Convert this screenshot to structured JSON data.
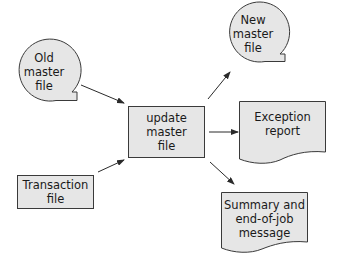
{
  "diagram": {
    "type": "system-flowchart",
    "colors": {
      "fill": "#e6e6e6",
      "stroke": "#3a3a3a",
      "text": "#1a1a1a",
      "background": "#ffffff"
    },
    "nodes": [
      {
        "id": "old_master",
        "shape": "magnetic-tape",
        "lines": [
          "Old",
          "master",
          "file"
        ]
      },
      {
        "id": "transaction",
        "shape": "process-rectangle",
        "lines": [
          "Transaction",
          "file"
        ]
      },
      {
        "id": "update",
        "shape": "process-rectangle",
        "lines": [
          "update",
          "master",
          "file"
        ]
      },
      {
        "id": "new_master",
        "shape": "magnetic-tape",
        "lines": [
          "New",
          "master",
          "file"
        ]
      },
      {
        "id": "exception",
        "shape": "document",
        "lines": [
          "Exception",
          "report"
        ]
      },
      {
        "id": "summary",
        "shape": "document",
        "lines": [
          "Summary and",
          "end-of-job",
          "message"
        ]
      }
    ],
    "edges": [
      {
        "from": "old_master",
        "to": "update"
      },
      {
        "from": "transaction",
        "to": "update"
      },
      {
        "from": "update",
        "to": "new_master"
      },
      {
        "from": "update",
        "to": "exception"
      },
      {
        "from": "update",
        "to": "summary"
      }
    ]
  }
}
